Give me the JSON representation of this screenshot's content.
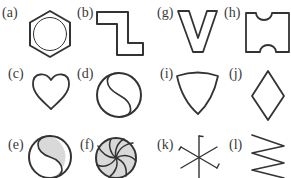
{
  "figure": {
    "panels": [
      {
        "id": "a",
        "label": "(a)",
        "shape": "hexagon-with-inscribed-circle"
      },
      {
        "id": "b",
        "label": "(b)",
        "shape": "z-shape"
      },
      {
        "id": "g",
        "label": "(g)",
        "shape": "v-shape"
      },
      {
        "id": "h",
        "label": "(h)",
        "shape": "ticket-with-notched-corners"
      },
      {
        "id": "c",
        "label": "(c)",
        "shape": "heart"
      },
      {
        "id": "d",
        "label": "(d)",
        "shape": "circle-with-s-curve"
      },
      {
        "id": "i",
        "label": "(i)",
        "shape": "reuleaux-triangle"
      },
      {
        "id": "j",
        "label": "(j)",
        "shape": "diamond"
      },
      {
        "id": "e",
        "label": "(e)",
        "shape": "yin-yang-shaded"
      },
      {
        "id": "f",
        "label": "(f)",
        "shape": "pinwheel-circle-shaded"
      },
      {
        "id": "k",
        "label": "(k)",
        "shape": "six-spoke-star-with-hooks"
      },
      {
        "id": "l",
        "label": "(l)",
        "shape": "zigzag-spring"
      }
    ],
    "colors": {
      "stroke": "#333333",
      "fill_shaded": "#d9d9d9",
      "label": "#3a3a3a",
      "background": "#ffffff"
    }
  }
}
